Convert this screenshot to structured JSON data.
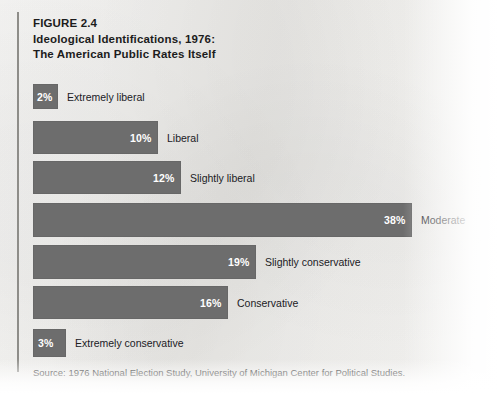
{
  "figure": {
    "number_label": "FIGURE 2.4",
    "title_line_1": "Ideological Identifications, 1976:",
    "title_line_2": "The American Public Rates Itself",
    "source": "Source: 1976 National Election Study, University of Michigan Center for Political Studies.",
    "bar_color": "#6d6d6d",
    "paper_color": "#f2f1ee",
    "rule_color": "#8e8d89"
  },
  "chart_data": {
    "type": "bar",
    "orientation": "horizontal",
    "title": "FIGURE 2.4 Ideological Identifications, 1976: The American Public Rates Itself",
    "subtitle": "",
    "xlabel": "",
    "ylabel": "",
    "grid": false,
    "legend": false,
    "value_unit": "percent",
    "xlim": [
      0,
      38
    ],
    "categories": [
      "Extremely liberal",
      "Liberal",
      "Slightly liberal",
      "Moderate",
      "Slightly conservative",
      "Conservative",
      "Extremely conservative"
    ],
    "values": [
      2,
      10,
      12,
      38,
      19,
      16,
      3
    ],
    "value_labels": [
      "2%",
      "10%",
      "12%",
      "38%",
      "19%",
      "16%",
      "3%"
    ],
    "annotations": [
      "Values printed in white inside the right end of each bar; category names printed to the right of each bar."
    ],
    "source": "Source: 1976 National Election Study, University of Michigan Center for Political Studies."
  },
  "bars": [
    {
      "label": "Extremely liberal",
      "value_label": "2%",
      "value": 2,
      "top": 84,
      "height": 25,
      "width": 25
    },
    {
      "label": "Liberal",
      "value_label": "10%",
      "value": 10,
      "top": 121,
      "height": 33,
      "width": 125
    },
    {
      "label": "Slightly liberal",
      "value_label": "12%",
      "value": 12,
      "top": 161,
      "height": 33,
      "width": 148
    },
    {
      "label": "Moderate",
      "value_label": "38%",
      "value": 38,
      "top": 203,
      "height": 34,
      "width": 379
    },
    {
      "label": "Slightly conservative",
      "value_label": "19%",
      "value": 19,
      "top": 245,
      "height": 34,
      "width": 223
    },
    {
      "label": "Conservative",
      "value_label": "16%",
      "value": 16,
      "top": 286,
      "height": 33,
      "width": 195
    },
    {
      "label": "Extremely conservative",
      "value_label": "3%",
      "value": 3,
      "top": 329,
      "height": 28,
      "width": 33
    }
  ]
}
